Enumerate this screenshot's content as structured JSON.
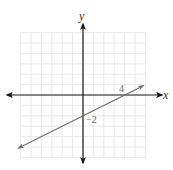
{
  "chart_data": {
    "type": "line",
    "title": "",
    "xlabel": "x",
    "ylabel": "y",
    "xlim": [
      -6,
      6
    ],
    "ylim": [
      -6,
      6
    ],
    "grid": true,
    "grid_step": 1,
    "legend": null,
    "series": [
      {
        "name": "line",
        "equation": "y = 0.5x - 2",
        "slope": 0.5,
        "intercept": -2,
        "x": [
          -6.2,
          5.8
        ],
        "y": [
          -5.1,
          0.9
        ],
        "arrows": "both"
      }
    ],
    "annotations": [
      {
        "text": "4",
        "x": 4,
        "y": 0,
        "meaning": "x-intercept"
      },
      {
        "text": "−2",
        "x": 0,
        "y": -2,
        "meaning": "y-intercept"
      }
    ],
    "colors": {
      "axis": "#1a1a1a",
      "grid": "#e2e2e2",
      "line": "#6e6e6e"
    }
  },
  "labels": {
    "x_axis": "x",
    "y_axis": "y",
    "x_intercept": "4",
    "y_intercept": "−2"
  }
}
